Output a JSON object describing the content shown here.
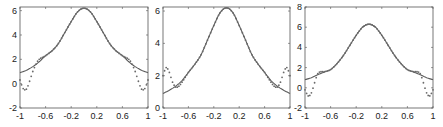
{
  "figure": {
    "colors": {
      "axis": "#555555",
      "solid": "#5a5a5a",
      "dotted": "#6a6a6a",
      "tick": "#222222"
    }
  },
  "chart_data": [
    {
      "type": "line",
      "title": "",
      "xlabel": "",
      "ylabel": "",
      "grid": false,
      "legend": null,
      "xlim": [
        -1,
        1
      ],
      "ylim": [
        -2,
        6.3
      ],
      "x_ticks": [
        -1,
        -0.6,
        -0.2,
        0.2,
        0.6,
        1
      ],
      "x_tick_labels": [
        "-1",
        "-0.6",
        "-0.2",
        "0.2",
        "0.6",
        "1"
      ],
      "y_ticks": [
        -2,
        0,
        2,
        4,
        6
      ],
      "y_tick_labels": [
        "-2",
        "0",
        "2",
        "4",
        "6"
      ],
      "series": [
        {
          "name": "solid",
          "style": "solid",
          "x": [
            -1,
            -0.9,
            -0.8,
            -0.7,
            -0.6,
            -0.5,
            -0.4,
            -0.3,
            -0.2,
            -0.1,
            0,
            0.1,
            0.2,
            0.3,
            0.4,
            0.5,
            0.6,
            0.7,
            0.8,
            0.9,
            1
          ],
          "y": [
            0.9,
            1.1,
            1.4,
            1.8,
            2.3,
            2.7,
            3.3,
            4.2,
            5.1,
            5.9,
            6.2,
            5.9,
            5.1,
            4.2,
            3.3,
            2.7,
            2.3,
            1.8,
            1.4,
            1.1,
            0.9
          ]
        },
        {
          "name": "dotted",
          "style": "dotted",
          "x": [
            -1,
            -0.95,
            -0.9,
            -0.85,
            -0.8,
            -0.75,
            -0.7,
            -0.6,
            -0.5,
            -0.4,
            -0.3,
            -0.2,
            -0.1,
            0,
            0.1,
            0.2,
            0.3,
            0.4,
            0.5,
            0.6,
            0.7,
            0.75,
            0.8,
            0.85,
            0.9,
            0.95,
            1
          ],
          "y": [
            0.3,
            -0.4,
            -0.45,
            0.2,
            1.0,
            1.6,
            2.0,
            2.3,
            2.7,
            3.3,
            4.2,
            5.1,
            5.9,
            6.2,
            5.9,
            5.1,
            4.2,
            3.3,
            2.7,
            2.3,
            2.0,
            1.6,
            1.0,
            0.2,
            -0.45,
            -0.4,
            0.3
          ]
        }
      ]
    },
    {
      "type": "line",
      "title": "",
      "xlabel": "",
      "ylabel": "",
      "grid": false,
      "legend": null,
      "xlim": [
        -1,
        1
      ],
      "ylim": [
        0,
        6.25
      ],
      "x_ticks": [
        -1,
        -0.6,
        -0.2,
        0.2,
        0.6,
        1
      ],
      "x_tick_labels": [
        "-1",
        "-0.6",
        "-0.2",
        "0.2",
        "0.6",
        "1"
      ],
      "y_ticks": [
        0,
        2,
        4,
        6
      ],
      "y_tick_labels": [
        "0",
        "2",
        "4",
        "6"
      ],
      "series": [
        {
          "name": "solid",
          "style": "solid",
          "x": [
            -1,
            -0.9,
            -0.8,
            -0.7,
            -0.6,
            -0.5,
            -0.4,
            -0.3,
            -0.2,
            -0.1,
            0,
            0.1,
            0.2,
            0.3,
            0.4,
            0.5,
            0.6,
            0.7,
            0.8,
            0.9,
            1
          ],
          "y": [
            0.9,
            1.1,
            1.35,
            1.7,
            2.2,
            2.7,
            3.3,
            4.2,
            5.1,
            5.9,
            6.2,
            5.9,
            5.1,
            4.2,
            3.3,
            2.7,
            2.2,
            1.7,
            1.35,
            1.1,
            0.9
          ]
        },
        {
          "name": "dotted",
          "style": "dotted",
          "x": [
            -1,
            -0.95,
            -0.9,
            -0.85,
            -0.8,
            -0.75,
            -0.7,
            -0.6,
            -0.5,
            -0.4,
            -0.3,
            -0.2,
            -0.1,
            0,
            0.1,
            0.2,
            0.3,
            0.4,
            0.5,
            0.6,
            0.7,
            0.75,
            0.8,
            0.85,
            0.9,
            0.95,
            1
          ],
          "y": [
            2.0,
            2.5,
            2.2,
            1.6,
            1.3,
            1.35,
            1.6,
            2.2,
            2.7,
            3.3,
            4.2,
            5.1,
            5.9,
            6.2,
            5.9,
            5.1,
            4.2,
            3.3,
            2.7,
            2.2,
            1.6,
            1.35,
            1.3,
            1.6,
            2.2,
            2.5,
            2.0
          ]
        }
      ]
    },
    {
      "type": "line",
      "title": "",
      "xlabel": "",
      "ylabel": "",
      "grid": false,
      "legend": null,
      "xlim": [
        -1,
        1
      ],
      "ylim": [
        -2,
        8
      ],
      "x_ticks": [
        -1,
        -0.6,
        -0.2,
        0.2,
        0.6,
        1
      ],
      "x_tick_labels": [
        "-1",
        "-0.6",
        "-0.2",
        "0.2",
        "0.6",
        "1"
      ],
      "y_ticks": [
        -2,
        0,
        2,
        4,
        6,
        8
      ],
      "y_tick_labels": [
        "-2",
        "0",
        "2",
        "4",
        "6",
        "8"
      ],
      "series": [
        {
          "name": "solid",
          "style": "solid",
          "x": [
            -1,
            -0.9,
            -0.8,
            -0.7,
            -0.6,
            -0.5,
            -0.4,
            -0.3,
            -0.2,
            -0.1,
            0,
            0.1,
            0.2,
            0.3,
            0.4,
            0.5,
            0.6,
            0.7,
            0.8,
            0.9,
            1
          ],
          "y": [
            0.8,
            1.0,
            1.3,
            1.55,
            1.8,
            2.4,
            3.2,
            4.2,
            5.2,
            6.0,
            6.3,
            6.0,
            5.2,
            4.2,
            3.2,
            2.4,
            1.8,
            1.55,
            1.3,
            1.0,
            0.8
          ]
        },
        {
          "name": "dotted",
          "style": "dotted",
          "x": [
            -1,
            -0.95,
            -0.9,
            -0.85,
            -0.8,
            -0.75,
            -0.7,
            -0.6,
            -0.5,
            -0.4,
            -0.3,
            -0.2,
            -0.1,
            0,
            0.1,
            0.2,
            0.3,
            0.4,
            0.5,
            0.6,
            0.7,
            0.75,
            0.8,
            0.85,
            0.9,
            0.95,
            1
          ],
          "y": [
            -0.2,
            -0.8,
            -0.5,
            0.5,
            1.4,
            1.6,
            1.6,
            1.8,
            2.4,
            3.2,
            4.2,
            5.2,
            6.0,
            6.3,
            6.0,
            5.2,
            4.2,
            3.2,
            2.4,
            1.8,
            1.6,
            1.6,
            1.4,
            0.5,
            -0.5,
            -0.8,
            -0.2
          ]
        }
      ]
    }
  ]
}
